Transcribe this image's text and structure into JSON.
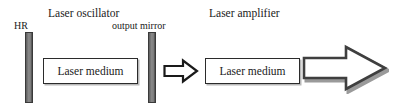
{
  "diagram": {
    "width": 400,
    "height": 111,
    "background_color": "#ffffff"
  },
  "labels": {
    "laser_oscillator": "Laser oscillator",
    "hr": "HR",
    "output_mirror": "output mirror",
    "laser_amplifier": "Laser amplifier"
  },
  "components": {
    "hr_mirror": {
      "name": "HR",
      "shape": "vertical-bar",
      "fill_color": "#808080",
      "stroke_color": "#3a3a3a"
    },
    "output_mirror": {
      "name": "output mirror",
      "shape": "vertical-bar",
      "fill_color": "#808080",
      "stroke_color": "#3a3a3a"
    },
    "oscillator_medium": {
      "label": "Laser medium",
      "shape": "rectangle",
      "fill_color": "#ffffff",
      "stroke_color": "#2b2b2b",
      "shadow_color": "#b8b8b8"
    },
    "amplifier_medium": {
      "label": "Laser medium",
      "shape": "rectangle",
      "fill_color": "#ffffff",
      "stroke_color": "#2b2b2b",
      "shadow_color": "#b8b8b8"
    },
    "beam_arrow_small": {
      "name": "output beam arrow",
      "shape": "block-arrow-right",
      "fill_color": "#ffffff",
      "stroke_color": "#1a1a1a"
    },
    "beam_arrow_large": {
      "name": "amplified beam arrow",
      "shape": "block-arrow-right",
      "fill_color": "#ffffff",
      "stroke_color": "#3f3f3f",
      "shadow_color": "#9a9a9a"
    }
  }
}
